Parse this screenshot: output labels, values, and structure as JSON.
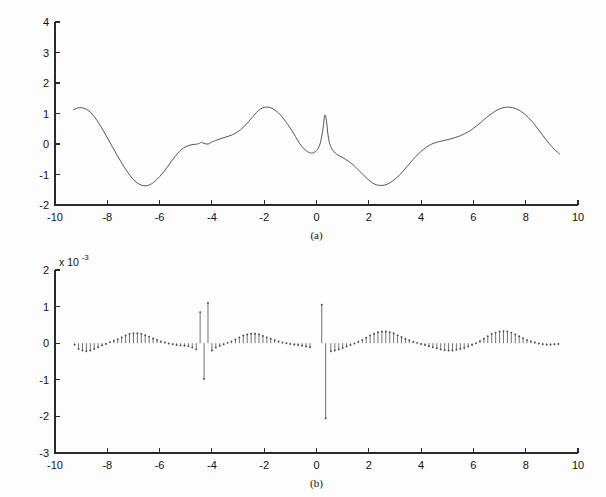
{
  "figure": {
    "background": "#fdfdfd",
    "ink_color": "#2b2b2b",
    "curve_color": "#555555",
    "stem_color": "#5a5a5a"
  },
  "chart_data": [
    {
      "id": "panel-a",
      "type": "line",
      "title": "",
      "caption": "(a)",
      "xlabel": "",
      "ylabel": "",
      "xlim": [
        -10,
        10
      ],
      "ylim": [
        -2,
        4
      ],
      "xticks": [
        -10,
        -8,
        -6,
        -4,
        -2,
        0,
        2,
        4,
        6,
        8,
        10
      ],
      "xtick_labels": [
        "-10",
        "-8",
        "-6",
        "-4",
        "-2",
        "0",
        "2",
        "4",
        "6",
        "8",
        "10"
      ],
      "yticks": [
        -2,
        -1,
        0,
        1,
        2,
        3,
        4
      ],
      "ytick_labels": [
        "-2",
        "-1",
        "0",
        "1",
        "2",
        "3",
        "4"
      ],
      "grid": false,
      "legend": "none",
      "series": [
        {
          "name": "signal",
          "x": [
            -9.3,
            -9.15,
            -9.0,
            -8.85,
            -8.7,
            -8.55,
            -8.4,
            -8.25,
            -8.1,
            -7.95,
            -7.8,
            -7.65,
            -7.5,
            -7.35,
            -7.2,
            -7.05,
            -6.9,
            -6.75,
            -6.6,
            -6.45,
            -6.3,
            -6.15,
            -6.0,
            -5.85,
            -5.7,
            -5.55,
            -5.4,
            -5.25,
            -5.1,
            -4.95,
            -4.8,
            -4.65,
            -4.55,
            -4.48,
            -4.44,
            -4.42,
            -4.4,
            -4.36,
            -4.3,
            -4.22,
            -4.14,
            -4.08,
            -4.04,
            -4.0,
            -3.96,
            -3.9,
            -3.8,
            -3.65,
            -3.5,
            -3.35,
            -3.2,
            -3.05,
            -2.9,
            -2.75,
            -2.6,
            -2.45,
            -2.3,
            -2.15,
            -2.0,
            -1.85,
            -1.7,
            -1.55,
            -1.4,
            -1.25,
            -1.1,
            -0.95,
            -0.8,
            -0.65,
            -0.5,
            -0.35,
            -0.2,
            -0.1,
            0.0,
            0.08,
            0.14,
            0.2,
            0.26,
            0.3,
            0.33,
            0.36,
            0.4,
            0.44,
            0.5,
            0.6,
            0.75,
            0.9,
            1.05,
            1.2,
            1.4,
            1.6,
            1.8,
            2.0,
            2.15,
            2.3,
            2.5,
            2.7,
            2.9,
            3.1,
            3.3,
            3.5,
            3.7,
            3.9,
            4.1,
            4.3,
            4.5,
            4.7,
            4.9,
            5.1,
            5.3,
            5.5,
            5.7,
            5.9,
            6.1,
            6.3,
            6.5,
            6.7,
            6.9,
            7.1,
            7.3,
            7.5,
            7.7,
            7.9,
            8.1,
            8.3,
            8.5,
            8.7,
            8.9,
            9.1,
            9.3
          ],
          "y": [
            1.12,
            1.18,
            1.19,
            1.16,
            1.08,
            0.95,
            0.78,
            0.58,
            0.36,
            0.13,
            -0.1,
            -0.33,
            -0.55,
            -0.76,
            -0.95,
            -1.12,
            -1.25,
            -1.33,
            -1.37,
            -1.36,
            -1.3,
            -1.2,
            -1.07,
            -0.92,
            -0.75,
            -0.57,
            -0.4,
            -0.25,
            -0.14,
            -0.07,
            -0.03,
            -0.01,
            0.0,
            0.02,
            0.04,
            0.05,
            0.05,
            0.04,
            0.02,
            0.0,
            0.0,
            0.02,
            0.05,
            0.07,
            0.08,
            0.1,
            0.13,
            0.18,
            0.22,
            0.26,
            0.31,
            0.38,
            0.47,
            0.59,
            0.73,
            0.88,
            1.03,
            1.14,
            1.2,
            1.21,
            1.17,
            1.09,
            0.97,
            0.82,
            0.64,
            0.45,
            0.24,
            0.02,
            -0.14,
            -0.25,
            -0.3,
            -0.28,
            -0.22,
            -0.12,
            0.02,
            0.25,
            0.58,
            0.88,
            0.95,
            0.88,
            0.62,
            0.3,
            0.02,
            -0.18,
            -0.32,
            -0.4,
            -0.47,
            -0.55,
            -0.68,
            -0.85,
            -1.02,
            -1.18,
            -1.28,
            -1.34,
            -1.36,
            -1.32,
            -1.22,
            -1.08,
            -0.9,
            -0.7,
            -0.5,
            -0.32,
            -0.17,
            -0.05,
            0.03,
            0.08,
            0.12,
            0.16,
            0.21,
            0.27,
            0.35,
            0.45,
            0.58,
            0.72,
            0.87,
            1.0,
            1.11,
            1.18,
            1.21,
            1.19,
            1.13,
            1.02,
            0.87,
            0.68,
            0.46,
            0.23,
            0.01,
            -0.18,
            -0.33
          ],
          "markers": "none",
          "style": "solid"
        }
      ],
      "annotations": [
        {
          "label": "discontinuity-notch",
          "x": -4.42,
          "description": "sharp downward V notch reaching about -0.30"
        },
        {
          "label": "discontinuity-peak",
          "x": -4.0,
          "description": "narrow peak reaching about 0.95"
        },
        {
          "label": "central-spike",
          "x": 0.28,
          "description": "tall narrow spike reaching about 3.2, shoulder at 1.2"
        }
      ]
    },
    {
      "id": "panel-b",
      "type": "stem",
      "title": "",
      "caption": "(b)",
      "xlabel": "",
      "ylabel": "",
      "y_multiplier_text": "x 10",
      "y_multiplier_exponent": "-3",
      "y_multiplier": 0.001,
      "xlim": [
        -10,
        10
      ],
      "ylim": [
        -3,
        2
      ],
      "xticks": [
        -10,
        -8,
        -6,
        -4,
        -2,
        0,
        2,
        4,
        6,
        8,
        10
      ],
      "xtick_labels": [
        "-10",
        "-8",
        "-6",
        "-4",
        "-2",
        "0",
        "2",
        "4",
        "6",
        "8",
        "10"
      ],
      "yticks": [
        -3,
        -2,
        -1,
        0,
        1,
        2
      ],
      "ytick_labels": [
        "-3",
        "-2",
        "-1",
        "0",
        "1",
        "2"
      ],
      "grid": false,
      "legend": "none",
      "series": [
        {
          "name": "detail-coefficients",
          "units": "x 10^-3",
          "x": [
            -9.25,
            -9.1,
            -8.95,
            -8.8,
            -8.65,
            -8.5,
            -8.35,
            -8.2,
            -8.05,
            -7.9,
            -7.75,
            -7.6,
            -7.45,
            -7.3,
            -7.15,
            -7.0,
            -6.85,
            -6.7,
            -6.55,
            -6.4,
            -6.25,
            -6.1,
            -5.95,
            -5.8,
            -5.65,
            -5.5,
            -5.35,
            -5.2,
            -5.05,
            -4.9,
            -4.75,
            -4.6,
            -4.45,
            -4.3,
            -4.15,
            -4.0,
            -3.85,
            -3.7,
            -3.55,
            -3.4,
            -3.25,
            -3.1,
            -2.95,
            -2.8,
            -2.65,
            -2.5,
            -2.35,
            -2.2,
            -2.05,
            -1.9,
            -1.75,
            -1.6,
            -1.45,
            -1.3,
            -1.15,
            -1.0,
            -0.85,
            -0.7,
            -0.55,
            -0.4,
            -0.25,
            0.2,
            0.35,
            0.55,
            0.7,
            0.85,
            1.0,
            1.15,
            1.3,
            1.45,
            1.6,
            1.75,
            1.9,
            2.05,
            2.2,
            2.35,
            2.5,
            2.65,
            2.8,
            2.95,
            3.1,
            3.25,
            3.4,
            3.55,
            3.7,
            3.85,
            4.0,
            4.15,
            4.3,
            4.45,
            4.6,
            4.75,
            4.9,
            5.05,
            5.2,
            5.35,
            5.5,
            5.65,
            5.8,
            5.95,
            6.1,
            6.25,
            6.4,
            6.55,
            6.7,
            6.85,
            7.0,
            7.15,
            7.3,
            7.45,
            7.6,
            7.75,
            7.9,
            8.05,
            8.2,
            8.35,
            8.5,
            8.65,
            8.8,
            8.95,
            9.1,
            9.25
          ],
          "y": [
            -0.04,
            -0.16,
            -0.2,
            -0.22,
            -0.2,
            -0.16,
            -0.11,
            -0.06,
            -0.02,
            0.03,
            0.07,
            0.11,
            0.16,
            0.21,
            0.25,
            0.27,
            0.27,
            0.25,
            0.22,
            0.18,
            0.13,
            0.09,
            0.05,
            0.02,
            -0.01,
            -0.03,
            -0.05,
            -0.06,
            -0.07,
            -0.08,
            -0.12,
            -0.17,
            0.85,
            -0.98,
            1.1,
            -0.2,
            -0.12,
            -0.07,
            -0.03,
            0.01,
            0.05,
            0.1,
            0.16,
            0.21,
            0.24,
            0.26,
            0.26,
            0.24,
            0.2,
            0.16,
            0.12,
            0.08,
            0.05,
            0.02,
            0.0,
            -0.02,
            -0.04,
            -0.05,
            -0.07,
            -0.09,
            -0.11,
            1.05,
            -2.05,
            -0.22,
            -0.2,
            -0.17,
            -0.13,
            -0.09,
            -0.05,
            -0.01,
            0.04,
            0.09,
            0.15,
            0.21,
            0.26,
            0.3,
            0.32,
            0.32,
            0.3,
            0.27,
            0.22,
            0.17,
            0.12,
            0.08,
            0.04,
            0.01,
            -0.02,
            -0.05,
            -0.08,
            -0.11,
            -0.14,
            -0.17,
            -0.19,
            -0.2,
            -0.2,
            -0.18,
            -0.16,
            -0.13,
            -0.09,
            -0.05,
            0.0,
            0.06,
            0.12,
            0.19,
            0.25,
            0.29,
            0.32,
            0.33,
            0.32,
            0.29,
            0.24,
            0.19,
            0.14,
            0.09,
            0.05,
            0.02,
            -0.01,
            -0.03,
            -0.04,
            -0.04,
            -0.03,
            -0.02
          ],
          "markers": "dot",
          "style": "stem"
        }
      ],
      "annotations": [
        {
          "label": "cluster-left",
          "x": -4.45,
          "description": "large stems at the -4.4 discontinuity, up to +1.1 and down to -1.0"
        },
        {
          "label": "cluster-center",
          "x": 0.2,
          "description": "large stems at the 0.2 discontinuity, up to +1.05 and down to -2.05"
        }
      ]
    }
  ]
}
